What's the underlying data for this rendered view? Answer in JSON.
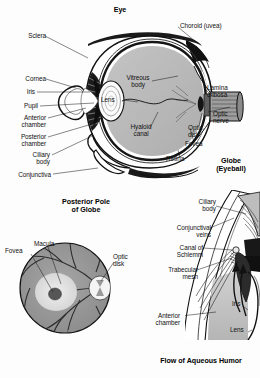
{
  "figure": {
    "background_color": "#fdfdfd",
    "ink_color": "#1a1a1a",
    "style": "black-and-white anatomical line drawing with gray wash shading"
  },
  "panels": {
    "eye_cross_section": {
      "title": "Eye",
      "corner_title": "Globe\n(Eyeball)",
      "labels": {
        "sclera": "Sclera",
        "cornea": "Cornea",
        "iris": "Iris",
        "pupil": "Pupil",
        "anterior_chamber": "Anterior\nchamber",
        "posterior_chamber": "Posterior\nchamber",
        "ciliary_body": "Ciliary\nbody",
        "conjunctiva": "Conjunctiva",
        "choroid": "Choroid (uvea)",
        "lamina_cribosa": "Lamina\ncribosa",
        "optic_nerve": "Optic\nnerve",
        "optic_disk": "Optic\ndisk",
        "fovea": "Fovea",
        "retina": "Retina",
        "vitreous_body": "Vitreous\nbody",
        "lens": "Lens",
        "hyaloid_canal": "Hyaloid\ncanal"
      }
    },
    "posterior_pole": {
      "title": "Posterior Pole\nof Globe",
      "labels": {
        "macula": "Macula",
        "fovea": "Fovea",
        "optic_disk": "Optic\ndisk"
      }
    },
    "aqueous_humor": {
      "title": "Flow of Aqueous Humor",
      "labels": {
        "ciliary_body": "Ciliary\nbody",
        "conjunctival_veins": "Conjunctival\nveins",
        "canal_of_schlemm": "Canal of\nSchlemm",
        "trabecular_mesh": "Trabecular\nmesh",
        "anterior_chamber": "Anterior\nchamber",
        "iris": "Iris",
        "lens": "Lens"
      }
    }
  },
  "colors": {
    "vitreous_fill": "#b9b9b9",
    "sclera_fill": "#ffffff",
    "fundus_fill": "#9a9a9a",
    "macula_fill": "#e3e3e3",
    "fovea_fill": "#5a5a5a",
    "disk_fill": "#f2f2f2",
    "outline": "#111111",
    "tissue_fill": "#c7c7c7"
  }
}
